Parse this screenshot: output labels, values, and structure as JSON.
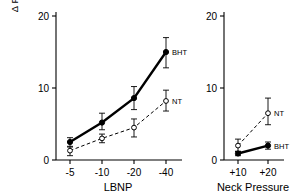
{
  "figure": {
    "ylabel_line1": "Δ Forearm Vascular Resistance",
    "ylabel_line2": "(mmHg/ml/min/100ml)",
    "background": "#ffffff",
    "ink": "#000000"
  },
  "chart_data": [
    {
      "type": "line",
      "panel": "left",
      "title": "",
      "xlabel": "LBNP",
      "ylabel": "Δ Forearm Vascular Resistance (mmHg/ml/min/100ml)",
      "categories": [
        "-5",
        "-10",
        "-20",
        "-40"
      ],
      "yticks": [
        "0",
        "10",
        "20"
      ],
      "ytick_values": [
        0,
        10,
        20
      ],
      "ylim": [
        0,
        20
      ],
      "grid": false,
      "legend": "inline-right",
      "series": [
        {
          "name": "BHT",
          "style": "solid",
          "marker": "filled-circle",
          "values": [
            2.5,
            5.2,
            8.6,
            15.0
          ],
          "err_low": [
            0.6,
            1.0,
            1.6,
            2.2
          ],
          "err_high": [
            0.6,
            1.3,
            1.6,
            2.0
          ],
          "label": "BHT"
        },
        {
          "name": "NT",
          "style": "dashed",
          "marker": "open-circle",
          "values": [
            1.3,
            3.0,
            4.5,
            8.2
          ],
          "err_low": [
            0.7,
            0.6,
            1.3,
            1.4
          ],
          "err_high": [
            0.5,
            0.6,
            1.2,
            1.5
          ],
          "label": "NT"
        }
      ]
    },
    {
      "type": "line",
      "panel": "right",
      "title": "",
      "xlabel": "Neck Pressure",
      "ylabel": "",
      "categories": [
        "+10",
        "+20"
      ],
      "yticks": [
        "0",
        "10",
        "20"
      ],
      "ytick_values": [
        0,
        10,
        20
      ],
      "ylim": [
        0,
        20
      ],
      "grid": false,
      "legend": "inline-right",
      "series": [
        {
          "name": "NT",
          "style": "dashed",
          "marker": "open-circle",
          "values": [
            2.0,
            6.5
          ],
          "err_low": [
            0.8,
            1.6
          ],
          "err_high": [
            0.9,
            2.1
          ],
          "label": "NT"
        },
        {
          "name": "BHT",
          "style": "solid",
          "marker": "filled-circle",
          "values": [
            0.9,
            2.0
          ],
          "err_low": [
            0.3,
            0.5
          ],
          "err_high": [
            0.3,
            0.5
          ],
          "label": "BHT"
        }
      ]
    }
  ]
}
